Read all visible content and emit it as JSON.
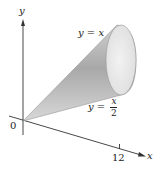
{
  "diagram": {
    "type": "solid-of-revolution",
    "axes": {
      "y_label": "y",
      "x_label": "x",
      "origin_label": "0",
      "x_tick_label": "12"
    },
    "curves": {
      "upper": {
        "lhs": "y",
        "eq": "=",
        "rhs": "x"
      },
      "lower": {
        "lhs": "y",
        "eq": "=",
        "num": "x",
        "den": "2"
      }
    },
    "colors": {
      "axis": "#333333",
      "cone_light": "#e6e6e6",
      "cone_dark": "#9a9a9a",
      "base_face": "#efefef"
    }
  }
}
